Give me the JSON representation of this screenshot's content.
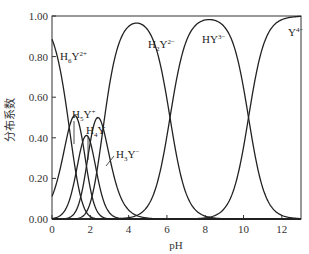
{
  "chart_data": {
    "type": "line",
    "title": "",
    "xlabel": "pH",
    "ylabel": "分布系数",
    "xlim": [
      0,
      13
    ],
    "ylim": [
      0,
      1.0
    ],
    "grid": false,
    "x_ticks": [
      "0",
      "2",
      "4",
      "6",
      "8",
      "10",
      "12"
    ],
    "y_ticks": [
      "0.00",
      "0.20",
      "0.40",
      "0.60",
      "0.80",
      "1.00"
    ],
    "pKa": [
      0.9,
      1.6,
      2.0,
      2.67,
      6.16,
      10.26
    ],
    "series": [
      {
        "name": "H6Y2+",
        "label_main": "H",
        "label_sub": "6",
        "label_tail": "Y",
        "label_sup": "2+",
        "x": [
          0,
          0.5,
          1.0,
          1.5,
          2.0,
          3.0
        ],
        "values": [
          0.87,
          0.71,
          0.44,
          0.17,
          0.05,
          0.0
        ]
      },
      {
        "name": "H5Y+",
        "label_main": "H",
        "label_sub": "5",
        "label_tail": "Y",
        "label_sup": "+",
        "x": [
          0,
          0.5,
          1.0,
          1.5,
          2.0,
          3.0,
          4.0
        ],
        "values": [
          0.11,
          0.28,
          0.48,
          0.42,
          0.21,
          0.02,
          0.0
        ]
      },
      {
        "name": "H4Y",
        "label_main": "H",
        "label_sub": "4",
        "label_tail": "Y",
        "label_sup": "",
        "x": [
          0,
          1.0,
          1.5,
          2.0,
          2.5,
          3.0,
          4.0
        ],
        "values": [
          0.0,
          0.12,
          0.33,
          0.4,
          0.27,
          0.1,
          0.01
        ]
      },
      {
        "name": "H3Y-",
        "label_main": "H",
        "label_sub": "3",
        "label_tail": "Y",
        "label_sup": "−",
        "x": [
          0,
          1.0,
          2.0,
          2.7,
          3.0,
          4.0,
          5.0
        ],
        "values": [
          0.0,
          0.03,
          0.25,
          0.48,
          0.45,
          0.14,
          0.01
        ]
      },
      {
        "name": "H2Y2-",
        "label_main": "H",
        "label_sub": "2",
        "label_tail": "Y",
        "label_sup": "2−",
        "x": [
          2.0,
          3.0,
          4.0,
          4.4,
          5.0,
          6.0,
          7.0,
          8.0
        ],
        "values": [
          0.05,
          0.43,
          0.93,
          0.96,
          0.89,
          0.59,
          0.13,
          0.01
        ]
      },
      {
        "name": "HY3-",
        "label_main": "HY",
        "label_sub": "",
        "label_tail": "",
        "label_sup": "3−",
        "x": [
          5.0,
          6.0,
          7.0,
          8.2,
          9.0,
          10.0,
          11.0
        ],
        "values": [
          0.06,
          0.4,
          0.87,
          0.98,
          0.94,
          0.64,
          0.15
        ]
      },
      {
        "name": "Y4-",
        "label_main": "Y",
        "label_sub": "",
        "label_tail": "",
        "label_sup": "4−",
        "x": [
          8.0,
          9.0,
          10.0,
          11.0,
          12.0,
          13.0
        ],
        "values": [
          0.01,
          0.05,
          0.35,
          0.85,
          0.98,
          1.0
        ]
      }
    ]
  }
}
